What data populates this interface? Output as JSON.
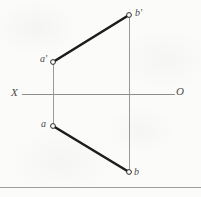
{
  "figure": {
    "width": 201,
    "height": 197,
    "background_color": "#fbfbfa",
    "axis": {
      "name": "ground-line",
      "left_label": "X",
      "right_label": "O",
      "y": 94,
      "x_start": 22,
      "x_end": 175,
      "color": "#8d8d8d",
      "stroke_width": 1
    },
    "points": [
      {
        "id": "b-prime",
        "label": "b'",
        "x": 129,
        "y": 15,
        "marker": "open-circle"
      },
      {
        "id": "a-prime",
        "label": "a'",
        "x": 53,
        "y": 62,
        "marker": "open-circle"
      },
      {
        "id": "a",
        "label": "a",
        "x": 53,
        "y": 126,
        "marker": "open-circle"
      },
      {
        "id": "b",
        "label": "b",
        "x": 129,
        "y": 172,
        "marker": "open-circle"
      }
    ],
    "segments": [
      {
        "id": "front-view-line",
        "label": "a'b'",
        "from": "a-prime",
        "to": "b-prime",
        "color": "#1c1c1c",
        "stroke_width": 2.6,
        "style": "solid"
      },
      {
        "id": "top-view-line",
        "label": "ab",
        "from": "a",
        "to": "b",
        "color": "#1c1c1c",
        "stroke_width": 2.6,
        "style": "solid"
      },
      {
        "id": "projector-a",
        "label": "a'a",
        "from": "a-prime",
        "to": "a",
        "color": "#9a9a9a",
        "stroke_width": 1,
        "style": "solid"
      },
      {
        "id": "projector-b",
        "label": "b'b",
        "from": "b-prime",
        "to": "b",
        "color": "#9a9a9a",
        "stroke_width": 1,
        "style": "solid"
      }
    ],
    "marker_style": {
      "radius": 2.4,
      "fill": "#fbfbfa",
      "stroke": "#2a2a2a",
      "stroke_width": 1
    },
    "bottom_rule": {
      "y": 187,
      "color": "#9e9e9e",
      "stroke_width": 1
    }
  }
}
